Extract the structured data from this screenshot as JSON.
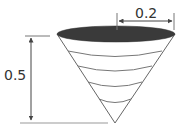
{
  "diagram": {
    "type": "cone-dimensions",
    "labels": {
      "radius": "0.2",
      "height": "0.5"
    },
    "colors": {
      "top_fill": "#3a3a3a",
      "stroke": "#555555",
      "dimension": "#444444"
    },
    "slice_count": 4
  }
}
